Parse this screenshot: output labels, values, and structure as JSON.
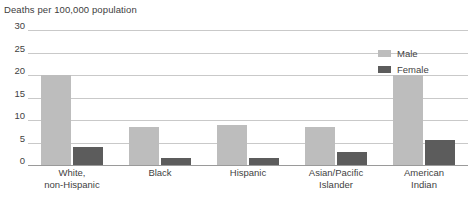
{
  "chart_data": {
    "type": "bar",
    "title": "Deaths per 100,000 population",
    "xlabel": "",
    "ylabel": "",
    "ylim": [
      0,
      30
    ],
    "yticks": [
      0,
      5,
      10,
      15,
      20,
      25,
      30
    ],
    "ytick_labels": [
      "0",
      "5",
      "10",
      "15",
      "20",
      "25",
      "30"
    ],
    "grid": true,
    "legend_position": "top-right",
    "categories": [
      "White,\nnon-Hispanic",
      "Black",
      "Hispanic",
      "Asian/Pacific\nIslander",
      "American\nIndian"
    ],
    "category_lines": [
      [
        "White,",
        "non-Hispanic"
      ],
      [
        "Black"
      ],
      [
        "Hispanic"
      ],
      [
        "Asian/Pacific",
        "Islander"
      ],
      [
        "American",
        "Indian"
      ]
    ],
    "series": [
      {
        "name": "Male",
        "color": "#bdbdbd",
        "values": [
          20,
          8.5,
          9,
          8.5,
          20
        ]
      },
      {
        "name": "Female",
        "color": "#5c5c5c",
        "values": [
          4,
          1.5,
          1.5,
          3,
          5.5
        ]
      }
    ]
  },
  "legend": {
    "items": [
      {
        "label": "Male",
        "color": "#bdbdbd"
      },
      {
        "label": "Female",
        "color": "#5c5c5c"
      }
    ]
  },
  "axis": {
    "tick_30": "30",
    "tick_25": "25",
    "tick_20": "20",
    "tick_15": "15",
    "tick_10": "10",
    "tick_5": "5",
    "tick_0": "0"
  },
  "colors": {
    "male": "#bdbdbd",
    "female": "#5c5c5c",
    "gridline": "#c9c9c9",
    "baseline": "#9a9a9a",
    "text": "#3f3f3f",
    "background": "#ffffff"
  }
}
